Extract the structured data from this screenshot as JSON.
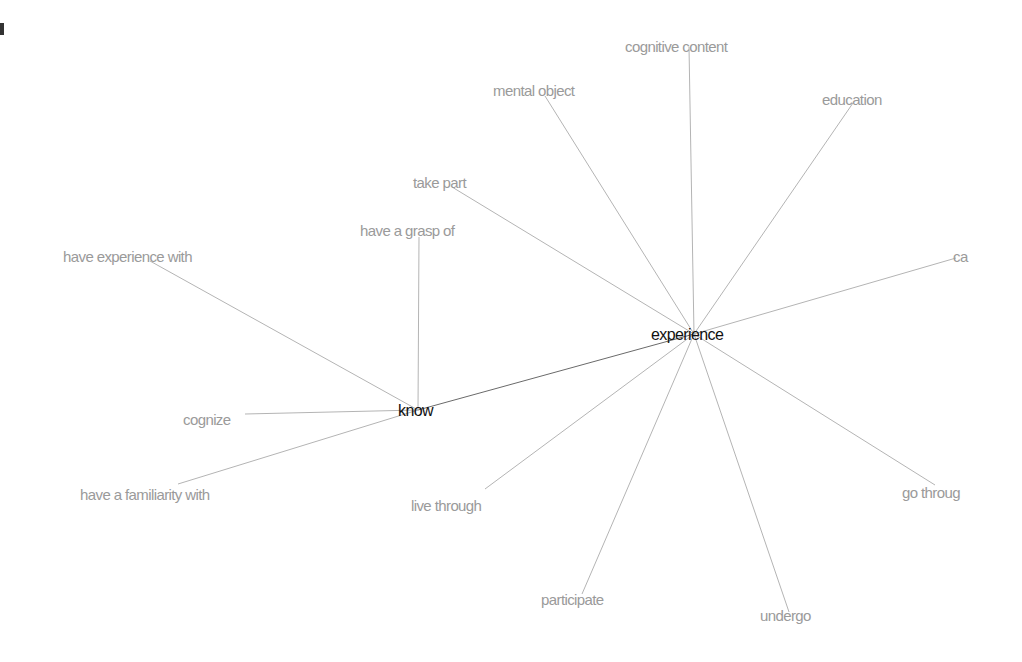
{
  "graph": {
    "title": "experience",
    "nodes": [
      {
        "id": "experience",
        "label": "experience",
        "type": "primary",
        "x": 694,
        "y": 334,
        "tx": 651,
        "ty": 327
      },
      {
        "id": "know",
        "label": "know",
        "type": "primary",
        "x": 418,
        "y": 410,
        "tx": 398,
        "ty": 403
      },
      {
        "id": "cognitive-content",
        "label": "cognitive content",
        "type": "secondary",
        "x": 689,
        "y": 47,
        "tx": 625,
        "ty": 39
      },
      {
        "id": "mental-object",
        "label": "mental object",
        "type": "secondary",
        "x": 545,
        "y": 96,
        "tx": 493,
        "ty": 83
      },
      {
        "id": "education",
        "label": "education",
        "type": "secondary",
        "x": 853,
        "y": 103,
        "tx": 822,
        "ty": 92
      },
      {
        "id": "take-part",
        "label": "take part",
        "type": "secondary",
        "x": 452,
        "y": 187,
        "tx": 413,
        "ty": 175
      },
      {
        "id": "ca",
        "label": "ca",
        "type": "secondary",
        "x": 956,
        "y": 258,
        "tx": 953,
        "ty": 249
      },
      {
        "id": "go-through",
        "label": "go throug",
        "type": "secondary",
        "x": 935,
        "y": 485,
        "tx": 902,
        "ty": 485
      },
      {
        "id": "undergo",
        "label": "undergo",
        "type": "secondary",
        "x": 789,
        "y": 612,
        "tx": 760,
        "ty": 608
      },
      {
        "id": "participate",
        "label": "participate",
        "type": "secondary",
        "x": 582,
        "y": 594,
        "tx": 541,
        "ty": 592
      },
      {
        "id": "live-through",
        "label": "live through",
        "type": "secondary",
        "x": 485,
        "y": 489,
        "tx": 411,
        "ty": 498
      },
      {
        "id": "have-a-grasp-of",
        "label": "have a grasp of",
        "type": "secondary",
        "x": 419,
        "y": 237,
        "tx": 360,
        "ty": 223
      },
      {
        "id": "have-experience-with",
        "label": "have experience with",
        "type": "secondary",
        "x": 150,
        "y": 261,
        "tx": 63,
        "ty": 249
      },
      {
        "id": "cognize",
        "label": "cognize",
        "type": "secondary",
        "x": 245,
        "y": 414,
        "tx": 183,
        "ty": 412
      },
      {
        "id": "have-a-familiarity-with",
        "label": "have a familiarity with",
        "type": "secondary",
        "x": 178,
        "y": 484,
        "tx": 80,
        "ty": 487
      }
    ],
    "edges": [
      {
        "from": "experience",
        "to": "know",
        "strong": true
      },
      {
        "from": "experience",
        "to": "cognitive-content"
      },
      {
        "from": "experience",
        "to": "mental-object"
      },
      {
        "from": "experience",
        "to": "education"
      },
      {
        "from": "experience",
        "to": "take-part"
      },
      {
        "from": "experience",
        "to": "ca"
      },
      {
        "from": "experience",
        "to": "go-through"
      },
      {
        "from": "experience",
        "to": "undergo"
      },
      {
        "from": "experience",
        "to": "participate"
      },
      {
        "from": "experience",
        "to": "live-through"
      },
      {
        "from": "know",
        "to": "have-a-grasp-of"
      },
      {
        "from": "know",
        "to": "have-experience-with"
      },
      {
        "from": "know",
        "to": "cognize"
      },
      {
        "from": "know",
        "to": "have-a-familiarity-with"
      }
    ],
    "colors": {
      "primary_text": "#111111",
      "secondary_text": "#9a9a9a",
      "edge": "#b4b4b4",
      "edge_strong": "#6a6a6a",
      "background": "#ffffff"
    }
  }
}
